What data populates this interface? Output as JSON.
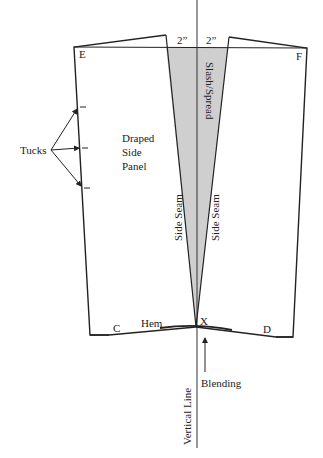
{
  "diagram": {
    "colors": {
      "line": "#222222",
      "shade": "#cfcfcf",
      "background": "#ffffff"
    },
    "labels": {
      "corner_e": "E",
      "corner_f": "F",
      "corner_c": "C",
      "corner_d": "D",
      "point_x": "X",
      "measure_left": "2”",
      "measure_right": "2”",
      "tucks": "Tucks",
      "panel_line1": "Draped",
      "panel_line2": "Side",
      "panel_line3": "Panel",
      "slash_spread": "Slash/Spread",
      "side_seam_left": "Side Seam",
      "side_seam_right": "Side Seam",
      "hem": "Hem",
      "blending": "Blending",
      "vertical_line": "Vertical Line"
    }
  }
}
